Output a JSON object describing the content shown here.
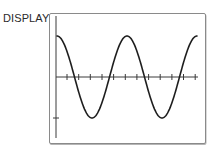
{
  "display": {
    "label": "DISPLAY:"
  },
  "chart_data": {
    "type": "line",
    "title": "",
    "xlabel": "",
    "ylabel": "",
    "function": "y = cos(x)",
    "periods_shown": 2,
    "x_ticks": 12,
    "y_ticks": 1,
    "grid": false,
    "legend": false,
    "pixel_geometry": {
      "axis_x_y": 77,
      "axis_y_x": 56,
      "curve_start_x": 57,
      "curve_end_x": 197,
      "period_px": 70,
      "amplitude_px": 41,
      "tick_spacing_px": 11.65,
      "first_tick_x": 67,
      "y_tick_y": 118
    },
    "colors": {
      "curve": "#1e1e1e",
      "axes": "#3a3a3a",
      "frame": "#8a8a8a"
    }
  }
}
